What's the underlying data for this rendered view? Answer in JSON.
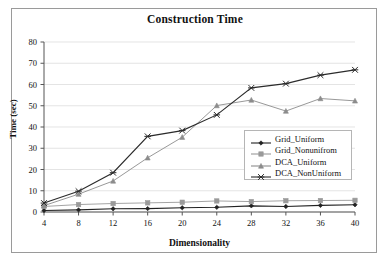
{
  "chart_data": {
    "type": "line",
    "title": "Construction Time",
    "xlabel": "Dimensionality",
    "ylabel": "Time (sec)",
    "x": [
      4,
      8,
      12,
      16,
      20,
      24,
      28,
      32,
      36,
      40
    ],
    "xticklabels": [
      "4",
      "8",
      "12",
      "16",
      "20",
      "24",
      "28",
      "32",
      "36",
      "40"
    ],
    "yticklabels": [
      "0",
      "10",
      "20",
      "30",
      "40",
      "50",
      "60",
      "70",
      "80"
    ],
    "yticks": [
      0,
      10,
      20,
      30,
      40,
      50,
      60,
      70,
      80
    ],
    "xlim": [
      4,
      40
    ],
    "ylim": [
      0,
      80
    ],
    "grid": "horizontal",
    "legend_position": "center-right",
    "series": [
      {
        "name": "Grid_Uniform",
        "values": [
          0.7,
          1.0,
          1.5,
          1.6,
          2.0,
          2.2,
          2.9,
          2.6,
          3.1,
          3.4
        ],
        "color": "#222222",
        "marker": "diamond"
      },
      {
        "name": "Grid_Nonunifrom",
        "values": [
          2.6,
          3.5,
          4.0,
          4.3,
          4.6,
          5.2,
          4.9,
          5.3,
          5.4,
          5.5
        ],
        "color": "#9a9a9a",
        "marker": "square"
      },
      {
        "name": "DCA_Uniform",
        "values": [
          3.0,
          8.4,
          14.6,
          25.5,
          35.2,
          50.1,
          52.7,
          47.5,
          53.4,
          52.3
        ],
        "color": "#8c8c8c",
        "marker": "triangle"
      },
      {
        "name": "DCA_NonUniform",
        "values": [
          4.2,
          9.8,
          18.5,
          35.6,
          38.3,
          45.7,
          58.4,
          60.4,
          64.4,
          66.9
        ],
        "color": "#2b2b2b",
        "marker": "cross"
      }
    ]
  },
  "colors": {
    "frame": "#9a9a9a",
    "axis": "#555555",
    "grid": "#d8d8d8",
    "background": "#ffffff",
    "text": "#111111"
  }
}
